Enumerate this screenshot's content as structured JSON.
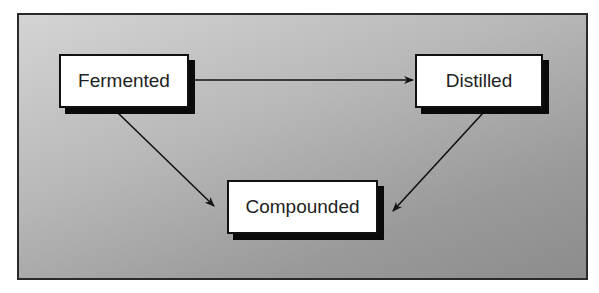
{
  "diagram": {
    "nodes": [
      {
        "id": "fermented",
        "label": "Fermented"
      },
      {
        "id": "distilled",
        "label": "Distilled"
      },
      {
        "id": "compounded",
        "label": "Compounded"
      }
    ],
    "edges": [
      {
        "from": "fermented",
        "to": "distilled"
      },
      {
        "from": "fermented",
        "to": "compounded"
      },
      {
        "from": "distilled",
        "to": "compounded"
      }
    ],
    "colors": {
      "frame_border": "#2a2a2a",
      "background_light": "#d4d4d4",
      "background_dark": "#8c8c8c",
      "node_fill": "#ffffff",
      "shadow": "#0a0a0a",
      "arrow": "#111111"
    }
  }
}
